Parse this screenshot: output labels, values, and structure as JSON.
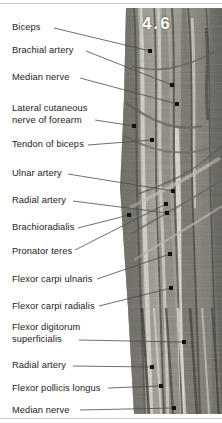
{
  "figure": {
    "number": "4.6",
    "specimen": "cadaveric-dissection-photograph"
  },
  "rules": {
    "top_color": "#c9c9c9",
    "bottom_color": "#c9c9c9"
  },
  "labels": [
    {
      "id": "biceps",
      "lines": [
        "Biceps"
      ],
      "x": 12,
      "y": 22,
      "line_start_x": 54,
      "line_start_y": 28,
      "line_end_x": 150,
      "line_end_y": 51,
      "dot_x": 150,
      "dot_y": 51
    },
    {
      "id": "brachial-artery",
      "lines": [
        "Brachial artery"
      ],
      "x": 12,
      "y": 45,
      "line_start_x": 86,
      "line_start_y": 51,
      "line_end_x": 172,
      "line_end_y": 85,
      "dot_x": 172,
      "dot_y": 85
    },
    {
      "id": "median-nerve",
      "lines": [
        "Median nerve"
      ],
      "x": 12,
      "y": 72,
      "line_start_x": 80,
      "line_start_y": 78,
      "line_end_x": 177,
      "line_end_y": 104,
      "dot_x": 177,
      "dot_y": 104
    },
    {
      "id": "lateral-cutaneous-nerve-of-forearm",
      "lines": [
        "Lateral cutaneous",
        "nerve of forearm"
      ],
      "x": 12,
      "y": 103,
      "line_start_x": 95,
      "line_start_y": 120,
      "line_end_x": 134,
      "line_end_y": 126,
      "dot_x": 134,
      "dot_y": 126
    },
    {
      "id": "tendon-of-biceps",
      "lines": [
        "Tendon of biceps"
      ],
      "x": 12,
      "y": 139,
      "line_start_x": 88,
      "line_start_y": 145,
      "line_end_x": 152,
      "line_end_y": 140,
      "dot_x": 152,
      "dot_y": 140
    },
    {
      "id": "ulnar-artery",
      "lines": [
        "Ulnar artery"
      ],
      "x": 12,
      "y": 168,
      "line_start_x": 68,
      "line_start_y": 174,
      "line_end_x": 173,
      "line_end_y": 191,
      "dot_x": 173,
      "dot_y": 191
    },
    {
      "id": "radial-artery-upper",
      "lines": [
        "Radial artery"
      ],
      "x": 12,
      "y": 195,
      "line_start_x": 73,
      "line_start_y": 201,
      "line_end_x": 167,
      "line_end_y": 213,
      "dot_x": 167,
      "dot_y": 213
    },
    {
      "id": "brachioradialis",
      "lines": [
        "Brachioradialis"
      ],
      "x": 12,
      "y": 222,
      "line_start_x": 78,
      "line_start_y": 228,
      "line_end_x": 129,
      "line_end_y": 215,
      "dot_x": 129,
      "dot_y": 215
    },
    {
      "id": "pronator-teres",
      "lines": [
        "Pronator teres"
      ],
      "x": 12,
      "y": 246,
      "line_start_x": 75,
      "line_start_y": 250,
      "line_end_x": 166,
      "line_end_y": 204,
      "dot_x": 166,
      "dot_y": 204
    },
    {
      "id": "flexor-carpi-ulnaris",
      "lines": [
        "Flexor carpi ulnaris"
      ],
      "x": 12,
      "y": 274,
      "line_start_x": 97,
      "line_start_y": 279,
      "line_end_x": 170,
      "line_end_y": 254,
      "dot_x": 170,
      "dot_y": 254
    },
    {
      "id": "flexor-carpi-radialis",
      "lines": [
        "Flexor carpi radialis"
      ],
      "x": 12,
      "y": 301,
      "line_start_x": 99,
      "line_start_y": 306,
      "line_end_x": 171,
      "line_end_y": 288,
      "dot_x": 171,
      "dot_y": 288
    },
    {
      "id": "flexor-digitorum-superficialis",
      "lines": [
        "Flexor digitorum",
        "superficialis"
      ],
      "x": 12,
      "y": 322,
      "line_start_x": 79,
      "line_start_y": 340,
      "line_end_x": 184,
      "line_end_y": 342,
      "dot_x": 184,
      "dot_y": 342
    },
    {
      "id": "radial-artery-lower",
      "lines": [
        "Radial artery"
      ],
      "x": 12,
      "y": 360,
      "line_start_x": 73,
      "line_start_y": 366,
      "line_end_x": 152,
      "line_end_y": 367,
      "dot_x": 152,
      "dot_y": 367
    },
    {
      "id": "flexor-pollicis-longus",
      "lines": [
        "Flexor pollicis longus"
      ],
      "x": 12,
      "y": 383,
      "line_start_x": 108,
      "line_start_y": 388,
      "line_end_x": 161,
      "line_end_y": 386,
      "dot_x": 161,
      "dot_y": 386
    },
    {
      "id": "median-nerve-lower",
      "lines": [
        "Median nerve"
      ],
      "x": 12,
      "y": 405,
      "line_start_x": 80,
      "line_start_y": 410,
      "line_end_x": 174,
      "line_end_y": 408,
      "dot_x": 174,
      "dot_y": 408
    }
  ],
  "styles": {
    "leader_color": "#4a4a4a",
    "dot_color": "#111111",
    "label_color": "#1c1c1c",
    "figure_number_color": "#ffffff"
  }
}
